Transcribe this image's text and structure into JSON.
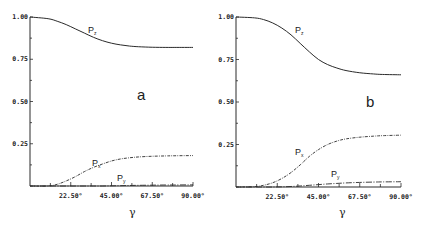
{
  "chart_data": [
    {
      "type": "line",
      "panel": "a",
      "title": "",
      "xlabel": "γ",
      "ylabel": "",
      "xlim": [
        0,
        90
      ],
      "ylim": [
        0,
        1.0
      ],
      "x_ticks": [
        "22.50°",
        "45.00°",
        "67.50°",
        "90.00°"
      ],
      "y_ticks": [
        "0.25",
        "0.50",
        "0.75",
        "1.00"
      ],
      "grid": false,
      "x": [
        0,
        10,
        15,
        20,
        25,
        30,
        35,
        40,
        45,
        50,
        55,
        60,
        67.5,
        75,
        80,
        90
      ],
      "series": [
        {
          "name": "Pz",
          "style": "solid",
          "values": [
            1.0,
            0.99,
            0.975,
            0.955,
            0.93,
            0.905,
            0.88,
            0.86,
            0.845,
            0.835,
            0.828,
            0.824,
            0.821,
            0.82,
            0.82,
            0.82
          ]
        },
        {
          "name": "Px",
          "style": "dash-dot",
          "values": [
            0.0,
            0.0,
            0.01,
            0.03,
            0.055,
            0.085,
            0.11,
            0.13,
            0.148,
            0.16,
            0.167,
            0.172,
            0.176,
            0.178,
            0.179,
            0.18
          ]
        },
        {
          "name": "Py",
          "style": "dash-dot-long",
          "values": [
            0.0,
            0.0,
            0.0,
            0.0,
            0.0,
            0.0,
            0.0,
            0.0,
            0.001,
            0.002,
            0.003,
            0.004,
            0.005,
            0.006,
            0.006,
            0.007
          ]
        }
      ],
      "annotations": [
        {
          "text": "P",
          "sub": "z",
          "near": "Pz curve"
        },
        {
          "text": "P",
          "sub": "x",
          "near": "Px curve"
        },
        {
          "text": "P",
          "sub": "y",
          "near": "Py curve"
        },
        {
          "text": "a",
          "role": "panel label"
        }
      ]
    },
    {
      "type": "line",
      "panel": "b",
      "title": "",
      "xlabel": "γ",
      "ylabel": "",
      "xlim": [
        0,
        90
      ],
      "ylim": [
        0,
        1.0
      ],
      "x_ticks": [
        "22.50°",
        "45.00°",
        "67.50°",
        "90.00°"
      ],
      "y_ticks": [
        "0.25",
        "0.50",
        "0.75",
        "1.00"
      ],
      "grid": false,
      "x": [
        0,
        10,
        15,
        20,
        25,
        30,
        35,
        40,
        45,
        50,
        55,
        60,
        67.5,
        75,
        80,
        90
      ],
      "series": [
        {
          "name": "Pz",
          "style": "solid",
          "values": [
            1.0,
            0.995,
            0.985,
            0.965,
            0.935,
            0.895,
            0.845,
            0.795,
            0.75,
            0.72,
            0.7,
            0.685,
            0.672,
            0.665,
            0.662,
            0.66
          ]
        },
        {
          "name": "Px",
          "style": "dash-dot",
          "values": [
            0.0,
            0.002,
            0.01,
            0.025,
            0.05,
            0.085,
            0.13,
            0.18,
            0.22,
            0.25,
            0.27,
            0.283,
            0.293,
            0.299,
            0.302,
            0.305
          ]
        },
        {
          "name": "Py",
          "style": "dash-dot-long",
          "values": [
            0.0,
            0.0,
            0.0,
            0.0,
            0.001,
            0.003,
            0.006,
            0.01,
            0.014,
            0.018,
            0.021,
            0.024,
            0.027,
            0.029,
            0.03,
            0.031
          ]
        }
      ],
      "annotations": [
        {
          "text": "P",
          "sub": "z",
          "near": "Pz curve"
        },
        {
          "text": "P",
          "sub": "x",
          "near": "Px curve"
        },
        {
          "text": "P",
          "sub": "y",
          "near": "Py curve"
        },
        {
          "text": "b",
          "role": "panel label"
        }
      ]
    }
  ],
  "labels": {
    "panel_a": "a",
    "panel_b": "b",
    "x_axis": "γ",
    "curve_p": "P",
    "sub_z": "z",
    "sub_x": "x",
    "sub_y": "y"
  },
  "colors": {
    "line": "#2a2a2a",
    "text": "#222222",
    "background": "#ffffff"
  }
}
